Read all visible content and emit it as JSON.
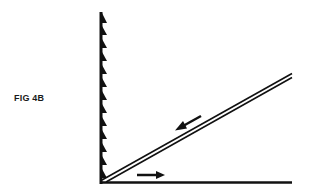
{
  "figure": {
    "label": "FIG 4B",
    "colors": {
      "ink": "#111111",
      "background": "#ffffff"
    },
    "elements": {
      "vertical_wall": {
        "description": "vertical line with sawtooth teeth on right side",
        "tooth_count": 13
      },
      "baseline": {
        "description": "horizontal base line"
      },
      "inclined_plane": {
        "description": "double diagonal line rising from vertex to upper right"
      },
      "arrows": [
        {
          "name": "down-left-arrow",
          "direction": "down-left along incline"
        },
        {
          "name": "right-arrow",
          "direction": "right along baseline"
        }
      ]
    }
  }
}
